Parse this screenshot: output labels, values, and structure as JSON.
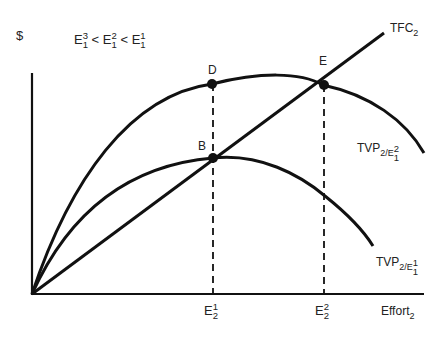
{
  "diagram": {
    "y_axis_label": "$",
    "x_axis_label": {
      "base": "Effort",
      "sub": "2"
    },
    "inequality": [
      {
        "base": "E",
        "sup": "3",
        "sub": "1"
      },
      {
        "op": "<"
      },
      {
        "base": "E",
        "sup": "2",
        "sub": "1"
      },
      {
        "op": "<"
      },
      {
        "base": "E",
        "sup": "1",
        "sub": "1"
      }
    ],
    "ineq_terms": {
      "t1": {
        "base": "E",
        "sup": "3",
        "sub": "1"
      },
      "op1": "<",
      "t2": {
        "base": "E",
        "sup": "2",
        "sub": "1"
      },
      "op2": "<",
      "t3": {
        "base": "E",
        "sup": "1",
        "sub": "1"
      }
    },
    "curves": {
      "tfc": {
        "base": "TFC",
        "sub": "2"
      },
      "tvp_upper": {
        "base": "TVP",
        "sub": "2/E",
        "sup": "2",
        "subsub": "1"
      },
      "tvp_lower": {
        "base": "TVP",
        "sub": "2/E",
        "sup": "1",
        "subsub": "1"
      }
    },
    "points": {
      "D": "D",
      "E": "E",
      "B": "B"
    },
    "x_ticks": {
      "e21": {
        "base": "E",
        "sup": "1",
        "sub": "2"
      },
      "e22": {
        "base": "E",
        "sup": "2",
        "sub": "2"
      }
    },
    "line_color": "#111111",
    "background": "#ffffff"
  }
}
